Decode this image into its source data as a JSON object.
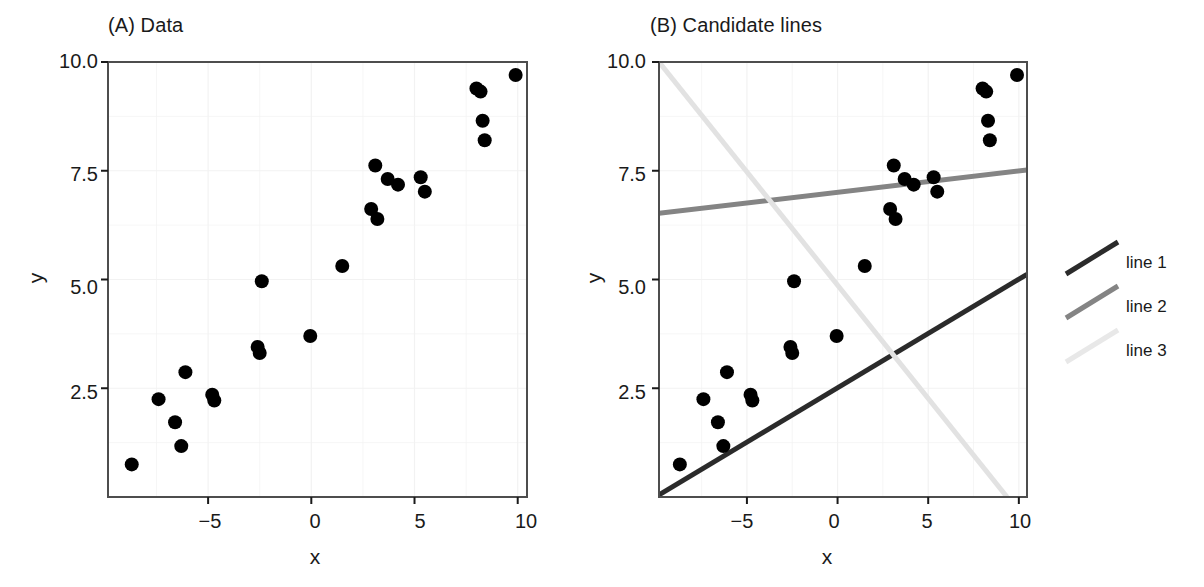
{
  "figure": {
    "width": 1204,
    "height": 587,
    "background": "#ffffff"
  },
  "chart_data": [
    {
      "type": "scatter",
      "title": "(A) Data",
      "xlabel": "x",
      "ylabel": "y",
      "xlim": [
        -9.85,
        10.45
      ],
      "ylim": [
        0.0,
        10.0
      ],
      "xticks": [
        -5,
        0,
        5,
        10
      ],
      "xtick_labels": [
        "−5",
        "0",
        "5",
        "10"
      ],
      "yticks": [
        2.5,
        5.0,
        7.5,
        10.0
      ],
      "ytick_labels": [
        "2.5",
        "5.0",
        "7.5",
        "10.0"
      ],
      "grid": true,
      "grid_color": "#f2f2f2",
      "point_color": "#000000",
      "point_size": 7,
      "points": [
        {
          "x": -8.7,
          "y": 0.75
        },
        {
          "x": -7.4,
          "y": 2.25
        },
        {
          "x": -6.6,
          "y": 1.72
        },
        {
          "x": -6.3,
          "y": 1.17
        },
        {
          "x": -6.1,
          "y": 2.87
        },
        {
          "x": -4.8,
          "y": 2.35
        },
        {
          "x": -4.7,
          "y": 2.22
        },
        {
          "x": -2.6,
          "y": 3.45
        },
        {
          "x": -2.5,
          "y": 3.31
        },
        {
          "x": -2.4,
          "y": 4.96
        },
        {
          "x": -0.05,
          "y": 3.7
        },
        {
          "x": 1.5,
          "y": 5.31
        },
        {
          "x": 2.9,
          "y": 6.62
        },
        {
          "x": 3.1,
          "y": 7.62
        },
        {
          "x": 3.2,
          "y": 6.39
        },
        {
          "x": 3.7,
          "y": 7.31
        },
        {
          "x": 4.2,
          "y": 7.18
        },
        {
          "x": 5.3,
          "y": 7.35
        },
        {
          "x": 5.5,
          "y": 7.02
        },
        {
          "x": 8.0,
          "y": 9.39
        },
        {
          "x": 8.2,
          "y": 9.32
        },
        {
          "x": 8.3,
          "y": 8.65
        },
        {
          "x": 8.4,
          "y": 8.2
        },
        {
          "x": 9.9,
          "y": 9.7
        }
      ]
    },
    {
      "type": "scatter",
      "title": "(B) Candidate lines",
      "xlabel": "x",
      "ylabel": "y",
      "xlim": [
        -9.85,
        10.45
      ],
      "ylim": [
        0.0,
        10.0
      ],
      "xticks": [
        -5,
        0,
        5,
        10
      ],
      "xtick_labels": [
        "−5",
        "0",
        "5",
        "10"
      ],
      "yticks": [
        2.5,
        5.0,
        7.5,
        10.0
      ],
      "ytick_labels": [
        "2.5",
        "5.0",
        "7.5",
        "10.0"
      ],
      "grid": true,
      "grid_color": "#f2f2f2",
      "point_color": "#000000",
      "point_size": 7,
      "points": [
        {
          "x": -8.7,
          "y": 0.75
        },
        {
          "x": -7.4,
          "y": 2.25
        },
        {
          "x": -6.6,
          "y": 1.72
        },
        {
          "x": -6.3,
          "y": 1.17
        },
        {
          "x": -6.1,
          "y": 2.87
        },
        {
          "x": -4.8,
          "y": 2.35
        },
        {
          "x": -4.7,
          "y": 2.22
        },
        {
          "x": -2.6,
          "y": 3.45
        },
        {
          "x": -2.5,
          "y": 3.31
        },
        {
          "x": -2.4,
          "y": 4.96
        },
        {
          "x": -0.05,
          "y": 3.7
        },
        {
          "x": 1.5,
          "y": 5.31
        },
        {
          "x": 2.9,
          "y": 6.62
        },
        {
          "x": 3.1,
          "y": 7.62
        },
        {
          "x": 3.2,
          "y": 6.39
        },
        {
          "x": 3.7,
          "y": 7.31
        },
        {
          "x": 4.2,
          "y": 7.18
        },
        {
          "x": 5.3,
          "y": 7.35
        },
        {
          "x": 5.5,
          "y": 7.02
        },
        {
          "x": 8.0,
          "y": 9.39
        },
        {
          "x": 8.2,
          "y": 9.32
        },
        {
          "x": 8.3,
          "y": 8.65
        },
        {
          "x": 8.4,
          "y": 8.2
        },
        {
          "x": 9.9,
          "y": 9.7
        }
      ],
      "lines": [
        {
          "name": "line 1",
          "color": "#2b2b2b",
          "width": 5,
          "x0": -9.85,
          "y0": 0.05,
          "x1": 10.45,
          "y1": 5.12
        },
        {
          "name": "line 2",
          "color": "#848484",
          "width": 5,
          "x0": -9.85,
          "y0": 6.52,
          "x1": 10.45,
          "y1": 7.52
        },
        {
          "name": "line 3",
          "color": "#e2e2e2",
          "width": 5,
          "x0": -9.85,
          "y0": 10.0,
          "x1": 9.35,
          "y1": 0.0
        }
      ]
    }
  ],
  "legend": {
    "position": "right",
    "entries": [
      {
        "label": "line 1",
        "color": "#2b2b2b"
      },
      {
        "label": "line 2",
        "color": "#848484"
      },
      {
        "label": "line 3",
        "color": "#e8e8e8"
      }
    ]
  }
}
